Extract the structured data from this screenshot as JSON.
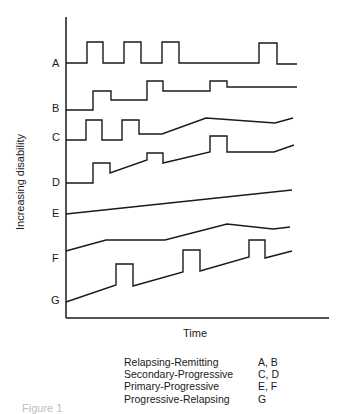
{
  "figure": {
    "y_axis_label": "Increasing disability",
    "x_axis_label": "Time",
    "caption_fragment": "Figure 1"
  },
  "curves": [
    {
      "label": "A"
    },
    {
      "label": "B"
    },
    {
      "label": "C"
    },
    {
      "label": "D"
    },
    {
      "label": "E"
    },
    {
      "label": "F"
    },
    {
      "label": "G"
    }
  ],
  "legend": [
    {
      "name": "Relapsing-Remitting",
      "curves": "A, B"
    },
    {
      "name": "Secondary-Progressive",
      "curves": "C, D"
    },
    {
      "name": "Primary-Progressive",
      "curves": "E, F"
    },
    {
      "name": "Progressive-Relapsing",
      "curves": "G"
    }
  ]
}
